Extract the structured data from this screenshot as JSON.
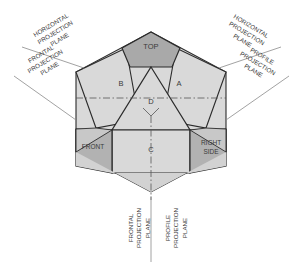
{
  "diagram": {
    "colors": {
      "panel_light": "#d9d9d9",
      "panel_mid": "#c2c2c2",
      "panel_dark": "#a9a9a9",
      "panel_front": "#b2b2b2",
      "outline": "#2b2b2b",
      "thin_line": "#555555",
      "text": "#3a3a3a",
      "background": "#ffffff"
    },
    "face_labels": [
      {
        "id": "top",
        "text": "TOP",
        "x": 151,
        "y": 49,
        "size": 7.5
      },
      {
        "id": "b",
        "text": "B",
        "x": 121,
        "y": 86,
        "size": 7.5
      },
      {
        "id": "a",
        "text": "A",
        "x": 179,
        "y": 86,
        "size": 7.5
      },
      {
        "id": "d",
        "text": "D",
        "x": 151,
        "y": 104,
        "size": 7.5
      },
      {
        "id": "c",
        "text": "C",
        "x": 151,
        "y": 152,
        "size": 7.5
      },
      {
        "id": "front",
        "text": "FRONT",
        "x": 93,
        "y": 149,
        "size": 6.5
      },
      {
        "id": "right-side-1",
        "text": "RIGHT",
        "x": 211,
        "y": 145,
        "size": 6.5
      },
      {
        "id": "right-side-2",
        "text": "SIDE",
        "x": 211,
        "y": 154,
        "size": 6.5
      }
    ],
    "callouts": [
      {
        "id": "horizontal-projection-plane-left",
        "lines": [
          "HORIZONTAL",
          "PROJECTION",
          "PLANE"
        ],
        "x": 52,
        "y": 27,
        "rotate": -31,
        "anchor": "middle",
        "size": 6.2
      },
      {
        "id": "frontal-projection-plane-left",
        "lines": [
          "FRONTAL",
          "PROJECTION",
          "PLANE"
        ],
        "x": 42,
        "y": 56,
        "rotate": -31,
        "anchor": "middle",
        "size": 6.2
      },
      {
        "id": "horizontal-projection-plane-right",
        "lines": [
          "HORIZONTAL",
          "PROJECTION",
          "PLANE"
        ],
        "x": 250,
        "y": 28,
        "rotate": 31,
        "anchor": "middle",
        "size": 6.2
      },
      {
        "id": "profile-projection-plane-right",
        "lines": [
          "PROFILE",
          "PROJECTION",
          "PLANE"
        ],
        "x": 261,
        "y": 58,
        "rotate": 31,
        "anchor": "middle",
        "size": 6.2
      },
      {
        "id": "frontal-projection-plane-bottom",
        "lines": [
          "FRONTAL",
          "PROJECTION",
          "PLANE"
        ],
        "x": 133,
        "y": 228,
        "rotate": -90,
        "anchor": "middle",
        "size": 6.2
      },
      {
        "id": "profile-projection-plane-bottom",
        "lines": [
          "PROFILE",
          "PROJECTION",
          "PLANE"
        ],
        "x": 170,
        "y": 228,
        "rotate": -90,
        "anchor": "middle",
        "size": 6.2
      }
    ]
  }
}
